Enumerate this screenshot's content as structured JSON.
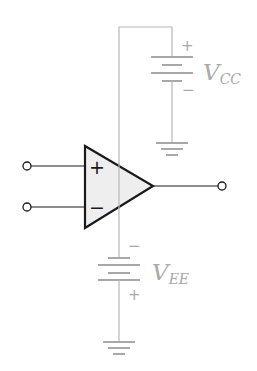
{
  "diagram": {
    "type": "op-amp circuit with dual supply",
    "opamp": {
      "noninverting_symbol": "+",
      "inverting_symbol": "−",
      "fill": "#eeeeee",
      "outline": "#1a1a1a"
    },
    "supplies": [
      {
        "id": "vcc",
        "label_main": "V",
        "label_sub": "CC",
        "positive": "+",
        "negative": "−"
      },
      {
        "id": "vee",
        "label_main": "V",
        "label_sub": "EE",
        "positive": "+",
        "negative": "−"
      }
    ],
    "terminals": [
      "noninverting-input",
      "inverting-input",
      "output"
    ],
    "wire_color": "#b8b8b8",
    "label_color": "#a9a9a9"
  }
}
